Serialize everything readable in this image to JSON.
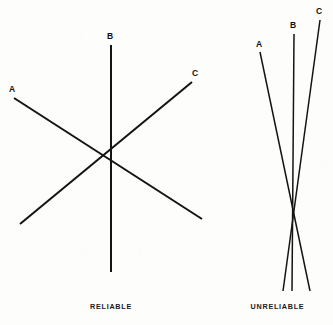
{
  "figure": {
    "background_color": "#fdfdfc",
    "ink_color": "#141414",
    "width": 333,
    "height": 325,
    "panels": [
      {
        "id": "reliable",
        "caption": "RELIABLE",
        "caption_center_x": 111,
        "caption_y": 308,
        "description": "Three straight lines crossing at nearly one common point, forming a small tight intersection",
        "labels": [
          {
            "text": "A",
            "x": 12,
            "y": 90,
            "line": "A"
          },
          {
            "text": "B",
            "x": 110,
            "y": 37,
            "line": "B"
          },
          {
            "text": "C",
            "x": 195,
            "y": 74,
            "line": "C"
          }
        ],
        "lines": [
          {
            "name": "A",
            "stroke_width": 2.05,
            "x1": 14,
            "y1": 98,
            "x2": 202,
            "y2": 219
          },
          {
            "name": "B",
            "stroke_width": 2.05,
            "x1": 111,
            "y1": 45,
            "x2": 111,
            "y2": 272
          },
          {
            "name": "C",
            "stroke_width": 2.05,
            "x1": 192,
            "y1": 82,
            "x2": 20,
            "y2": 224
          }
        ]
      },
      {
        "id": "unreliable",
        "caption": "UNRELIABLE",
        "caption_center_x": 293,
        "caption_y": 308,
        "description": "Three steep lines at shallow mutual angles crossing at three separate points, forming an elongated cocked-hat triangle",
        "labels": [
          {
            "text": "A",
            "x": 259,
            "y": 45,
            "line": "A"
          },
          {
            "text": "B",
            "x": 293,
            "y": 26,
            "line": "B"
          },
          {
            "text": "C",
            "x": 319,
            "y": 12,
            "line": "C"
          }
        ],
        "lines": [
          {
            "name": "A",
            "stroke_width": 1.5,
            "x1": 260,
            "y1": 52,
            "x2": 310,
            "y2": 291
          },
          {
            "name": "B",
            "stroke_width": 1.5,
            "x1": 294,
            "y1": 34,
            "x2": 292,
            "y2": 291
          },
          {
            "name": "C",
            "stroke_width": 1.5,
            "x1": 320,
            "y1": 20,
            "x2": 283,
            "y2": 291
          }
        ]
      }
    ]
  }
}
